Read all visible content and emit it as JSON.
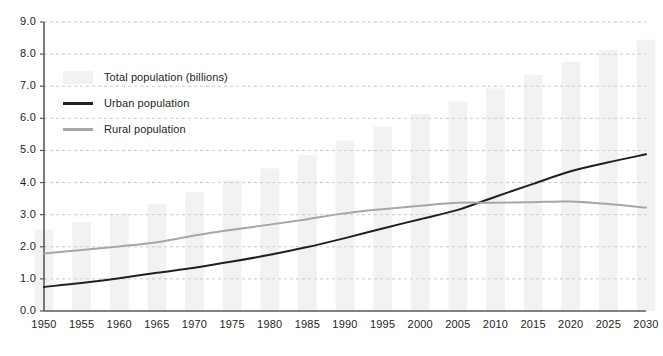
{
  "chart_data": {
    "type": "line",
    "title": "",
    "xlabel": "",
    "ylabel": "",
    "xlim": [
      1950,
      2030
    ],
    "ylim": [
      0.0,
      9.0
    ],
    "ytick_step": 1.0,
    "grid": true,
    "grid_style": "horizontal-dashed",
    "legend_position": "upper-left-inside",
    "categories": [
      1950,
      1955,
      1960,
      1965,
      1970,
      1975,
      1980,
      1985,
      1990,
      1995,
      2000,
      2005,
      2010,
      2015,
      2020,
      2025,
      2030
    ],
    "xtick_labels": [
      "1950",
      "1955",
      "1960",
      "1965",
      "1970",
      "1975",
      "1980",
      "1985",
      "1990",
      "1995",
      "2000",
      "2005",
      "2010",
      "2015",
      "2020",
      "2025",
      "2030"
    ],
    "ytick_labels": [
      "0.0",
      "1.0",
      "2.0",
      "3.0",
      "4.0",
      "5.0",
      "6.0",
      "7.0",
      "8.0",
      "9.0"
    ],
    "ytick_values": [
      0.0,
      1.0,
      2.0,
      3.0,
      4.0,
      5.0,
      6.0,
      7.0,
      8.0,
      9.0
    ],
    "series": [
      {
        "name": "Total population (billions)",
        "type": "bar",
        "color": "#f2f2f2",
        "values": [
          2.54,
          2.77,
          3.03,
          3.33,
          3.7,
          4.07,
          4.44,
          4.85,
          5.31,
          5.74,
          6.14,
          6.52,
          6.93,
          7.35,
          7.76,
          8.13,
          8.45
        ]
      },
      {
        "name": "Urban population",
        "type": "line",
        "color": "#231f20",
        "values": [
          0.75,
          0.87,
          1.02,
          1.19,
          1.35,
          1.54,
          1.75,
          1.99,
          2.27,
          2.57,
          2.86,
          3.15,
          3.56,
          3.96,
          4.35,
          4.63,
          4.88
        ]
      },
      {
        "name": "Rural population",
        "type": "line",
        "color": "#a6a6a6",
        "values": [
          1.79,
          1.9,
          2.01,
          2.14,
          2.35,
          2.53,
          2.69,
          2.86,
          3.04,
          3.17,
          3.28,
          3.37,
          3.37,
          3.39,
          3.41,
          3.33,
          3.22
        ]
      }
    ],
    "annotations": [
      "Urban and rural population curves cross at approximately 2010 at about 3.4 billion",
      "Rural population peaks near 3.4 billion around 2015-2020 and declines thereafter"
    ]
  },
  "legend": {
    "items": [
      {
        "label": "Total population (billions)",
        "marker": "swatch",
        "color": "#f2f2f2"
      },
      {
        "label": "Urban population",
        "marker": "line",
        "color": "#231f20"
      },
      {
        "label": "Rural population",
        "marker": "line",
        "color": "#a6a6a6"
      }
    ]
  },
  "axes": {
    "axis_color": "#58595b",
    "grid_color": "#c9c9c9",
    "text_color": "#231f20"
  }
}
